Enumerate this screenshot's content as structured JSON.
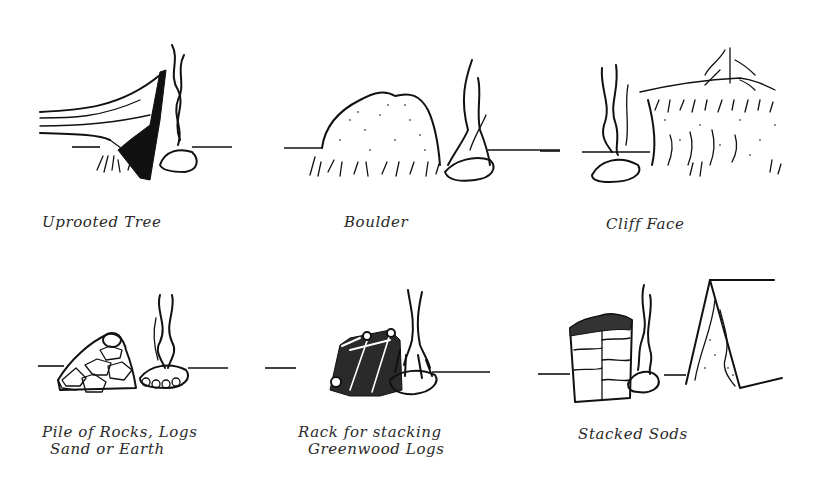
{
  "figure": {
    "title": "",
    "ink_color": "#111111",
    "background_color": "#ffffff"
  },
  "panels": [
    {
      "id": "uprooted-tree",
      "caption_lines": [
        "Uprooted Tree"
      ]
    },
    {
      "id": "boulder",
      "caption_lines": [
        "Boulder"
      ]
    },
    {
      "id": "cliff-face",
      "caption_lines": [
        "Cliff Face"
      ]
    },
    {
      "id": "pile-of-rocks",
      "caption_lines": [
        "Pile of Rocks, Logs",
        "Sand or Earth"
      ]
    },
    {
      "id": "rack-greenwood-logs",
      "caption_lines": [
        "Rack for stacking",
        "Greenwood Logs"
      ]
    },
    {
      "id": "stacked-sods",
      "caption_lines": [
        "Stacked Sods"
      ]
    }
  ]
}
